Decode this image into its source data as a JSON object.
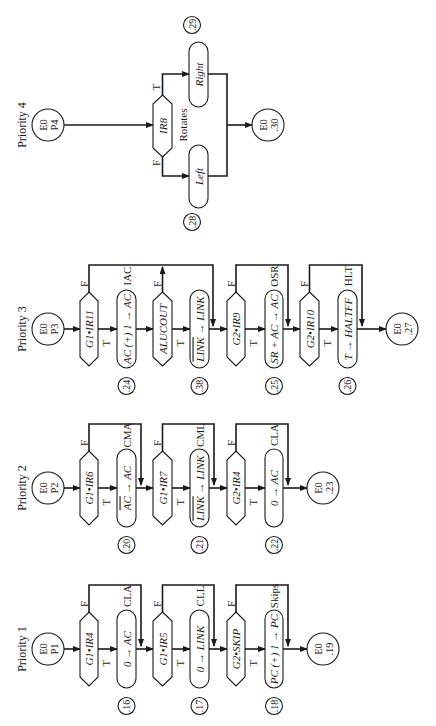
{
  "diagram": {
    "orientation": "rotated-90-ccw",
    "colors": {
      "ink": "#1a1a1a",
      "background": "#ffffff"
    },
    "flows": [
      {
        "id": "p1",
        "label": "Priority 1",
        "start": {
          "line1": "E0",
          "line2": "P1"
        },
        "steps": [
          {
            "type": "decision",
            "text": "G1•IR4",
            "true": "T",
            "false": "F",
            "instruction": "CLA"
          },
          {
            "type": "process",
            "text": "0 → AC",
            "state": ".16"
          },
          {
            "type": "decision",
            "text": "G1•IR5",
            "true": "T",
            "false": "F",
            "instruction": "CLL"
          },
          {
            "type": "process",
            "text": "0 → LINK",
            "state": ".17"
          },
          {
            "type": "decision",
            "text": "G2•SKIP",
            "true": "T",
            "false": "F",
            "instruction": "Skips"
          },
          {
            "type": "process",
            "text": "PC (+) 1 → PC",
            "state": ".18"
          }
        ],
        "end": {
          "line1": "E0",
          "line2": ".19"
        }
      },
      {
        "id": "p2",
        "label": "Priority 2",
        "start": {
          "line1": "E0",
          "line2": "P2"
        },
        "steps": [
          {
            "type": "decision",
            "text": "G1•IR6",
            "true": "T",
            "false": "F",
            "instruction": "CMA"
          },
          {
            "type": "process",
            "text": "AC̅ → AC",
            "state": ".20"
          },
          {
            "type": "decision",
            "text": "G1•IR7",
            "true": "T",
            "false": "F",
            "instruction": "CML"
          },
          {
            "type": "process",
            "text": "LINK̅ → LINK",
            "state": ".21"
          },
          {
            "type": "decision",
            "text": "G2•IR4",
            "true": "T",
            "false": "F",
            "instruction": "CLA"
          },
          {
            "type": "process",
            "text": "0 → AC",
            "state": ".22"
          }
        ],
        "end": {
          "line1": "E0",
          "line2": ".23"
        }
      },
      {
        "id": "p3",
        "label": "Priority 3",
        "start": {
          "line1": "E0",
          "line2": "P3"
        },
        "steps": [
          {
            "type": "decision",
            "text": "G1•IR11",
            "true": "T",
            "false": "F",
            "instruction": "IAC"
          },
          {
            "type": "process",
            "text": "AC (+) 1 → AC",
            "state": ".24"
          },
          {
            "type": "decision",
            "text": "ALUCOUT",
            "true": "T",
            "false": "F"
          },
          {
            "type": "process",
            "text": "LINK̅ → LINK",
            "state": ".38"
          },
          {
            "type": "decision",
            "text": "G2•IR9",
            "true": "T",
            "false": "F",
            "instruction": "OSR"
          },
          {
            "type": "process",
            "text": "SR + AC → AC",
            "state": ".25"
          },
          {
            "type": "decision",
            "text": "G2•IR10",
            "true": "T",
            "false": "F",
            "instruction": "HLT"
          },
          {
            "type": "process",
            "text": "T → HALTFF",
            "state": ".26"
          }
        ],
        "end": {
          "line1": "E0",
          "line2": ".27"
        }
      },
      {
        "id": "p4",
        "label": "Priority 4",
        "start": {
          "line1": "E0",
          "line2": "P4"
        },
        "decision": {
          "text": "IR8",
          "true": "T",
          "false": "F",
          "instruction": "Rotates"
        },
        "branches": {
          "true": {
            "text": "Right",
            "state": ".29"
          },
          "false": {
            "text": "Left",
            "state": ".28"
          }
        },
        "end": {
          "line1": "E0",
          "line2": ".30"
        }
      }
    ]
  }
}
